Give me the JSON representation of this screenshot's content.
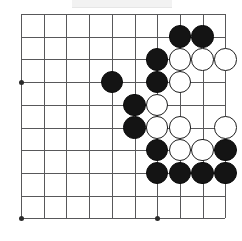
{
  "figure": {
    "kind": "go-board-diagram",
    "title": "",
    "caption": "",
    "board": {
      "columns": 10,
      "rows": 10,
      "origin_x": 21,
      "origin_y": 14,
      "spacing": 22.7,
      "line_color": "#58585a",
      "background_color": "#ffffff",
      "stone_radius": 11.3
    },
    "star_points": [
      {
        "col": 1,
        "row": 4
      },
      {
        "col": 1,
        "row": 10
      },
      {
        "col": 7,
        "row": 10
      }
    ],
    "stones": [
      {
        "color": "black",
        "col": 8,
        "row": 2
      },
      {
        "color": "black",
        "col": 9,
        "row": 2
      },
      {
        "color": "black",
        "col": 7,
        "row": 3
      },
      {
        "color": "white",
        "col": 8,
        "row": 3
      },
      {
        "color": "white",
        "col": 9,
        "row": 3
      },
      {
        "color": "white",
        "col": 10,
        "row": 3
      },
      {
        "color": "black",
        "col": 5,
        "row": 4
      },
      {
        "color": "black",
        "col": 7,
        "row": 4
      },
      {
        "color": "white",
        "col": 8,
        "row": 4
      },
      {
        "color": "black",
        "col": 6,
        "row": 5
      },
      {
        "color": "white",
        "col": 7,
        "row": 5
      },
      {
        "color": "black",
        "col": 6,
        "row": 6
      },
      {
        "color": "white",
        "col": 7,
        "row": 6
      },
      {
        "color": "white",
        "col": 8,
        "row": 6
      },
      {
        "color": "white",
        "col": 10,
        "row": 6
      },
      {
        "color": "black",
        "col": 7,
        "row": 7
      },
      {
        "color": "white",
        "col": 8,
        "row": 7
      },
      {
        "color": "white",
        "col": 9,
        "row": 7
      },
      {
        "color": "black",
        "col": 10,
        "row": 7
      },
      {
        "color": "black",
        "col": 7,
        "row": 8
      },
      {
        "color": "black",
        "col": 8,
        "row": 8
      },
      {
        "color": "black",
        "col": 9,
        "row": 8
      },
      {
        "color": "black",
        "col": 10,
        "row": 8
      }
    ],
    "counts": {
      "black_stones": 13,
      "white_stones": 10
    }
  }
}
